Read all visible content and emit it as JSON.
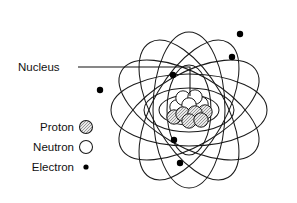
{
  "figure": {
    "kind": "atom-structure-diagram",
    "background_color": "#ffffff",
    "line_color": "#1b1b1b"
  },
  "callout": {
    "label": "Nucleus",
    "label_x": 18,
    "label_y": 71,
    "leader": {
      "start_x": 78,
      "start_y": 67,
      "corner_x": 190,
      "corner_y": 67,
      "end_x": 190,
      "end_y": 96
    }
  },
  "legend": {
    "items": [
      {
        "label": "Proton",
        "marker": "gray-filled-circle",
        "color": "#b4b4b4",
        "radius": 6.5,
        "text_x": 74,
        "text_y": 131,
        "marker_x": 86,
        "marker_y": 127
      },
      {
        "label": "Neutron",
        "marker": "white-circle",
        "color": "#ffffff",
        "radius": 6.5,
        "text_x": 74,
        "text_y": 151,
        "marker_x": 86,
        "marker_y": 147
      },
      {
        "label": "Electron",
        "marker": "black-dot",
        "color": "#000000",
        "radius": 2.6,
        "text_x": 74,
        "text_y": 171,
        "marker_x": 86,
        "marker_y": 167
      }
    ]
  },
  "atom": {
    "center_x": 189,
    "center_y": 110,
    "orbits": [
      {
        "name": "outer-orbit-1",
        "rx": 78,
        "ry": 36,
        "rotate": 0
      },
      {
        "name": "outer-orbit-2",
        "rx": 78,
        "ry": 36,
        "rotate": 60
      },
      {
        "name": "outer-orbit-3",
        "rx": 78,
        "ry": 36,
        "rotate": 120
      },
      {
        "name": "outer-orbit-4",
        "rx": 78,
        "ry": 36,
        "rotate": 30
      },
      {
        "name": "outer-orbit-5",
        "rx": 78,
        "ry": 36,
        "rotate": 90
      },
      {
        "name": "outer-orbit-6",
        "rx": 78,
        "ry": 36,
        "rotate": 150
      },
      {
        "name": "inner-orbit-1",
        "rx": 45,
        "ry": 22,
        "rotate": 0
      },
      {
        "name": "inner-orbit-2",
        "rx": 45,
        "ry": 22,
        "rotate": 90
      },
      {
        "name": "inner-orbit-3",
        "rx": 30,
        "ry": 15,
        "rotate": 0
      }
    ],
    "electrons": [
      {
        "name": "electron-top-right-outer",
        "x": 240,
        "y": 34,
        "r": 3.2
      },
      {
        "name": "electron-right-upper",
        "x": 232,
        "y": 57,
        "r": 3.2
      },
      {
        "name": "electron-left-outer",
        "x": 100,
        "y": 90,
        "r": 3.2
      },
      {
        "name": "electron-upper-inner",
        "x": 173,
        "y": 75,
        "r": 3.2
      },
      {
        "name": "electron-lower-inner",
        "x": 174,
        "y": 140,
        "r": 3.2
      },
      {
        "name": "electron-bottom",
        "x": 180,
        "y": 163,
        "r": 3.2
      }
    ],
    "nucleus": {
      "particles": [
        {
          "type": "neutron",
          "x": 183,
          "y": 98,
          "r": 7.2
        },
        {
          "type": "neutron",
          "x": 195,
          "y": 97,
          "r": 7.2
        },
        {
          "type": "neutron",
          "x": 189,
          "y": 105,
          "r": 7.2
        },
        {
          "type": "neutron",
          "x": 177,
          "y": 107,
          "r": 7.2
        },
        {
          "type": "neutron",
          "x": 201,
          "y": 104,
          "r": 7.2
        },
        {
          "type": "proton",
          "x": 183,
          "y": 114,
          "r": 7.2
        },
        {
          "type": "proton",
          "x": 195,
          "y": 113,
          "r": 7.2
        },
        {
          "type": "proton",
          "x": 205,
          "y": 112,
          "r": 7.2
        },
        {
          "type": "proton",
          "x": 174,
          "y": 117,
          "r": 7.2
        },
        {
          "type": "proton",
          "x": 189,
          "y": 121,
          "r": 7.2
        },
        {
          "type": "proton",
          "x": 201,
          "y": 120,
          "r": 7.2
        }
      ]
    }
  }
}
